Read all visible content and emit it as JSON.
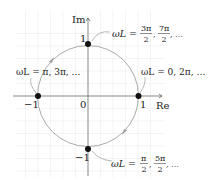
{
  "diagram": {
    "axes": {
      "x_label": "Re",
      "y_label": "Im",
      "origin_label": "0",
      "ticks": {
        "x_pos": "1",
        "x_neg": "−1",
        "y_pos": "1",
        "y_neg": "−1"
      }
    },
    "points": [
      {
        "name": "top",
        "coords": [
          0,
          1
        ],
        "label_lhs": "ωL =",
        "frac1_num": "3π",
        "frac1_den": "2",
        "frac2_num": "7π",
        "frac2_den": "2",
        "tail": ", …"
      },
      {
        "name": "right",
        "coords": [
          1,
          0
        ],
        "label": "ωL = 0, 2π, …"
      },
      {
        "name": "left",
        "coords": [
          -1,
          0
        ],
        "label": "ωL = π, 3π, …"
      },
      {
        "name": "bottom",
        "coords": [
          0,
          -1
        ],
        "label_lhs": "ωL =",
        "frac1_num": "π",
        "frac1_den": "2",
        "frac2_num": "5π",
        "frac2_den": "2",
        "tail": ", …"
      }
    ],
    "colors": {
      "circle": "#a0a0a0",
      "grid": "#ececec",
      "axis": "#555555",
      "dot": "#111111",
      "leader": "#999999"
    }
  }
}
